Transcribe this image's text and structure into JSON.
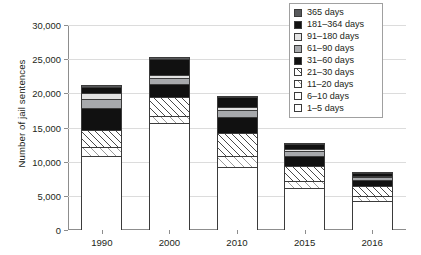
{
  "chart_data": {
    "type": "bar",
    "subtype": "stacked",
    "title": "",
    "xlabel": "",
    "ylabel": "Number of jail sentences",
    "categories": [
      "1990",
      "2000",
      "2010",
      "2015",
      "2016"
    ],
    "ylim": [
      0,
      30000
    ],
    "ytick_values": [
      0,
      5000,
      10000,
      15000,
      20000,
      25000,
      30000
    ],
    "ytick_labels": [
      "0",
      "5,000",
      "10,000",
      "15,000",
      "20,000",
      "25,000",
      "30,000"
    ],
    "grid": true,
    "grid_axis": "y",
    "legend_position": "top-right",
    "stack_order_bottom_to_top": [
      "1–5 days",
      "6–10 days",
      "11–20 days",
      "21–30 days",
      "31–60 days",
      "61–90 days",
      "91–180 days",
      "181–364 days",
      "365 days"
    ],
    "series": [
      {
        "name": "1–5 days",
        "fill": "cross",
        "color": "#ffffff",
        "values": [
          7600,
          11200,
          5100,
          3400,
          2600
        ]
      },
      {
        "name": "6–10 days",
        "fill": "dots",
        "color": "#ffffff",
        "values": [
          3300,
          4500,
          4100,
          2700,
          1700
        ]
      },
      {
        "name": "11–20 days",
        "fill": "hatch-light",
        "color": "#ffffff",
        "values": [
          1200,
          1000,
          1600,
          1100,
          700
        ]
      },
      {
        "name": "21–30 days",
        "fill": "hatch",
        "color": "#ffffff",
        "values": [
          2600,
          2700,
          3400,
          2200,
          1400
        ]
      },
      {
        "name": "31–60 days",
        "fill": "solid-black",
        "color": "#111111",
        "values": [
          3100,
          1900,
          2400,
          1500,
          900
        ]
      },
      {
        "name": "61–90 days",
        "fill": "solid-mid",
        "color": "#a7a9ac",
        "values": [
          1400,
          900,
          900,
          600,
          400
        ]
      },
      {
        "name": "91–180 days",
        "fill": "solid-light",
        "color": "#e3e3e3",
        "values": [
          800,
          500,
          500,
          300,
          200
        ]
      },
      {
        "name": "181–364 days",
        "fill": "solid-black",
        "color": "#111111",
        "values": [
          900,
          2300,
          1400,
          800,
          500
        ]
      },
      {
        "name": "365 days",
        "fill": "solid-dark",
        "color": "#58595b",
        "values": [
          300,
          300,
          200,
          100,
          100
        ]
      }
    ],
    "totals": [
      21200,
      25300,
      19600,
      12700,
      8500
    ]
  },
  "legend": {
    "items": [
      {
        "label": "365 days",
        "swatch": "solid-dark"
      },
      {
        "label": "181–364 days",
        "swatch": "solid-black"
      },
      {
        "label": "91–180 days",
        "swatch": "solid-light"
      },
      {
        "label": "61–90 days",
        "swatch": "solid-mid"
      },
      {
        "label": "31–60 days",
        "swatch": "solid-black"
      },
      {
        "label": "21–30 days",
        "swatch": "hatch"
      },
      {
        "label": "11–20 days",
        "swatch": "hatch-light"
      },
      {
        "label": "6–10 days",
        "swatch": "dots"
      },
      {
        "label": "1–5 days",
        "swatch": "cross"
      }
    ]
  },
  "axes": {
    "y_title": "Number of jail sentences"
  }
}
